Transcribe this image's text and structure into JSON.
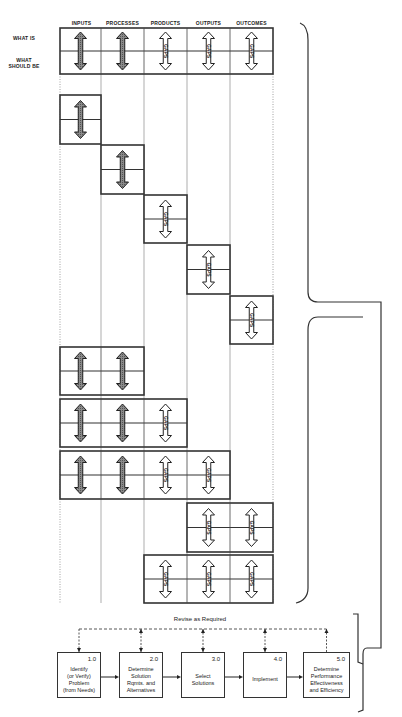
{
  "columns": [
    "INPUTS",
    "PROCESSES",
    "PRODUCTS",
    "OUTPUTS",
    "OUTCOMES"
  ],
  "row_labels": {
    "what_is": "WHAT IS",
    "what_should_be": "WHAT\nSHOULD BE"
  },
  "gap_label": "GAPS",
  "arrow_styles": {
    "filled": "#6e6e6e",
    "hollow": "#ffffff",
    "stroke": "#222222"
  },
  "matrix_rows": [
    {
      "name": "full-matrix",
      "cols": [
        0,
        1,
        2,
        3,
        4
      ],
      "top": 28,
      "bottom": 74
    },
    {
      "name": "inputs-only",
      "cols": [
        0
      ],
      "top": 95,
      "bottom": 144
    },
    {
      "name": "processes-only",
      "cols": [
        1
      ],
      "top": 145,
      "bottom": 194
    },
    {
      "name": "products-only",
      "cols": [
        2
      ],
      "top": 195,
      "bottom": 243
    },
    {
      "name": "outputs-only",
      "cols": [
        3
      ],
      "top": 245,
      "bottom": 294
    },
    {
      "name": "outcomes-only",
      "cols": [
        4
      ],
      "top": 296,
      "bottom": 344
    },
    {
      "name": "inputs-processes",
      "cols": [
        0,
        1
      ],
      "top": 347,
      "bottom": 395
    },
    {
      "name": "inputs-to-products",
      "cols": [
        0,
        1,
        2
      ],
      "top": 399,
      "bottom": 447
    },
    {
      "name": "inputs-to-outputs",
      "cols": [
        0,
        1,
        2,
        3
      ],
      "top": 451,
      "bottom": 499
    },
    {
      "name": "outputs-outcomes",
      "cols": [
        3,
        4
      ],
      "top": 503,
      "bottom": 552
    },
    {
      "name": "products-to-outcomes",
      "cols": [
        2,
        3,
        4
      ],
      "top": 555,
      "bottom": 603
    }
  ],
  "process": {
    "feedback_label": "Revise as Required",
    "steps": [
      {
        "num": "1.0",
        "text": "Identify\n(or Verify)\nProblem\n(from Needs)"
      },
      {
        "num": "2.0",
        "text": "Determine\nSolution\nRqmts. and\nAlternatives"
      },
      {
        "num": "3.0",
        "text": "Select\nSolutions"
      },
      {
        "num": "4.0",
        "text": "Implement"
      },
      {
        "num": "5.0",
        "text": "Determine\nPerformance\nEffectiveness\nand Efficiency"
      }
    ]
  }
}
